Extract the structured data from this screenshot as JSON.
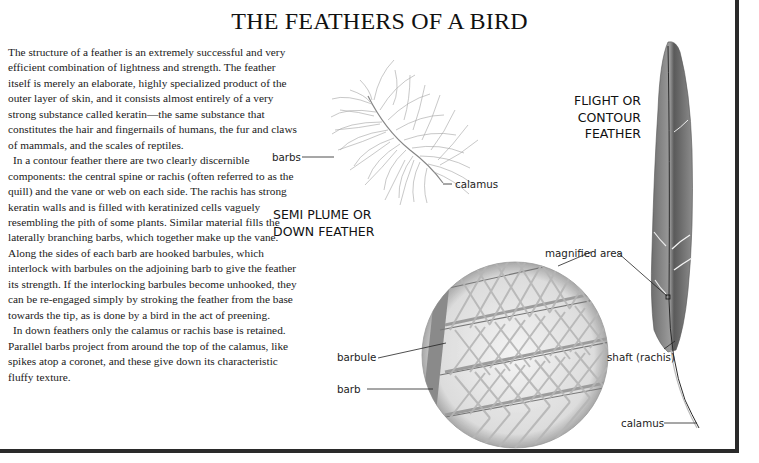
{
  "title": "THE FEATHERS OF A BIRD",
  "body": {
    "paragraphs": [
      "The structure of a feather is an extremely successful and very efficient combination of lightness and strength. The feather itself is merely an elaborate, highly specialized product of the outer layer of skin, and it consists almost entirely of a very strong substance called keratin—the same substance that constitutes the hair and fingernails of humans, the fur and claws of mammals, and the scales of reptiles.",
      "In a contour feather there are two clearly discernible components: the central spine or rachis (often referred to as the quill) and the vane or web on each side. The rachis has strong keratin walls and is filled with keratinized cells vaguely resembling the pith of some plants. Similar material fills the laterally branching barbs, which together make up the vane. Along the sides of each barb are hooked barbules, which interlock with barbules on the adjoining barb to give the feather its strength. If the interlocking barbules become unhooked, they can be re-engaged simply by stroking the feather from the base towards the tip, as is done by a bird in the act of preening.",
      "In down feathers only the calamus or rachis base is retained. Parallel barbs project from around the top of the calamus, like spikes atop a coronet, and these give down its characteristic fluffy texture."
    ]
  },
  "illustrations": {
    "down_feather": {
      "heading_lines": [
        "SEMI PLUME OR",
        "DOWN FEATHER"
      ],
      "labels": {
        "barbs": "barbs",
        "calamus": "calamus"
      }
    },
    "contour_feather": {
      "heading_lines": [
        "FLIGHT OR",
        "CONTOUR",
        "FEATHER"
      ],
      "labels": {
        "magnified_area": "magnified area",
        "shaft": "shaft (rachis)",
        "calamus": "calamus"
      }
    },
    "magnified_view": {
      "labels": {
        "barbule": "barbule",
        "barb": "barb"
      }
    }
  },
  "colors": {
    "frame": "#2a2a2a",
    "feather_dark": "#4a4a4a",
    "feather_mid": "#8a8a8a",
    "down_strokes": "#9a9a9a"
  }
}
